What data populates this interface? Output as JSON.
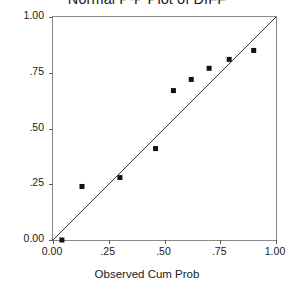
{
  "chart_data": {
    "type": "scatter",
    "title": "Normal P-P Plot of DIFF",
    "xlabel": "Observed Cum Prob",
    "ylabel": "Expected Cum Prob",
    "xlim": [
      0.0,
      1.0
    ],
    "ylim": [
      0.0,
      1.0
    ],
    "grid": false,
    "legend": "none",
    "xticks": [
      {
        "value": 0.0,
        "label": "0.00"
      },
      {
        "value": 0.25,
        "label": ".25"
      },
      {
        "value": 0.5,
        "label": ".50"
      },
      {
        "value": 0.75,
        "label": ".75"
      },
      {
        "value": 1.0,
        "label": "1.00"
      }
    ],
    "yticks": [
      {
        "value": 0.0,
        "label": "0.00"
      },
      {
        "value": 0.25,
        "label": ".25"
      },
      {
        "value": 0.5,
        "label": ".50"
      },
      {
        "value": 0.75,
        "label": ".75"
      },
      {
        "value": 1.0,
        "label": "1.00"
      }
    ],
    "series": [
      {
        "name": "observations",
        "marker": "square",
        "color": "#121212",
        "points": [
          {
            "x": 0.04,
            "y": 0.0
          },
          {
            "x": 0.13,
            "y": 0.24
          },
          {
            "x": 0.3,
            "y": 0.28
          },
          {
            "x": 0.46,
            "y": 0.41
          },
          {
            "x": 0.54,
            "y": 0.67
          },
          {
            "x": 0.62,
            "y": 0.72
          },
          {
            "x": 0.7,
            "y": 0.77
          },
          {
            "x": 0.79,
            "y": 0.81
          },
          {
            "x": 0.9,
            "y": 0.85
          }
        ]
      }
    ],
    "reference_line": {
      "name": "identity-line",
      "from": {
        "x": 0.0,
        "y": 0.0
      },
      "to": {
        "x": 1.0,
        "y": 1.0
      },
      "color": "#2e2e2e"
    }
  }
}
